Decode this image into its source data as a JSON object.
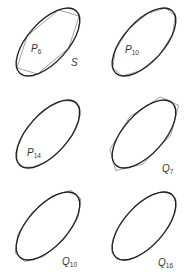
{
  "figure": {
    "curve_label": "S",
    "panels": [
      {
        "id": "p6",
        "letter": "P",
        "n": "6",
        "kind": "inscribed",
        "sides": 6
      },
      {
        "id": "p10",
        "letter": "P",
        "n": "10",
        "kind": "inscribed",
        "sides": 10
      },
      {
        "id": "p14",
        "letter": "P",
        "n": "14",
        "kind": "inscribed",
        "sides": 14
      },
      {
        "id": "q7",
        "letter": "Q",
        "n": "7",
        "kind": "circumscribed",
        "sides": 7
      },
      {
        "id": "q10",
        "letter": "Q",
        "n": "10",
        "kind": "circumscribed",
        "sides": 10
      },
      {
        "id": "q16",
        "letter": "Q",
        "n": "16",
        "kind": "circumscribed",
        "sides": 16
      }
    ],
    "colors": {
      "curve": "#222222",
      "polygon": "#8a8a8a",
      "label": "#333333"
    }
  }
}
